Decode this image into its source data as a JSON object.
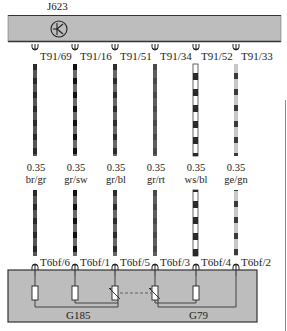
{
  "diagram": {
    "top_module": {
      "label": "J623",
      "symbol": "control-unit-k-icon",
      "fill": "#bdbdbd",
      "border": "#333333"
    },
    "wires": [
      {
        "top_terminal": "T91/69",
        "size": "0.35",
        "color_code": "br/gr",
        "bottom_terminal": "T6bf/6",
        "x": 35,
        "pattern": "dark-gray-stripe"
      },
      {
        "top_terminal": "T91/16",
        "size": "0.35",
        "color_code": "gr/sw",
        "bottom_terminal": "T6bf/1",
        "x": 75,
        "pattern": "gray-black-stripe"
      },
      {
        "top_terminal": "T91/51",
        "size": "0.35",
        "color_code": "gr/bl",
        "bottom_terminal": "T6bf/5",
        "x": 115,
        "pattern": "gray-dark-stripe"
      },
      {
        "top_terminal": "T91/34",
        "size": "0.35",
        "color_code": "gr/rt",
        "bottom_terminal": "T6bf/3",
        "x": 155,
        "pattern": "gray-solid"
      },
      {
        "top_terminal": "T91/52",
        "size": "0.35",
        "color_code": "ws/bl",
        "bottom_terminal": "T6bf/4",
        "x": 196,
        "pattern": "white-black-stripe"
      },
      {
        "top_terminal": "T91/33",
        "size": "0.35",
        "color_code": "ge/gn",
        "bottom_terminal": "T6bf/2",
        "x": 236,
        "pattern": "light-dark-stripe"
      }
    ],
    "bottom_module": {
      "sensors": [
        {
          "label": "G185"
        },
        {
          "label": "G79"
        }
      ],
      "fill": "#bdbdbd",
      "border": "#333333"
    }
  }
}
